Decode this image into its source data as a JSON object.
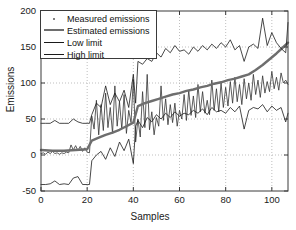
{
  "chart_data": {
    "type": "line",
    "title": "",
    "xlabel": "Samples",
    "ylabel": "Emissions",
    "xlim": [
      0,
      107
    ],
    "ylim": [
      -50,
      200
    ],
    "xticks": [
      0,
      20,
      40,
      60,
      80,
      100
    ],
    "yticks": [
      -50,
      0,
      50,
      100,
      150,
      200
    ],
    "grid": true,
    "grid_style": "dotted",
    "legend_position": "upper-left",
    "legend": [
      {
        "label": "Measured emissions",
        "style": "dot",
        "color": "#555555"
      },
      {
        "label": "Estimated emissions",
        "style": "line",
        "color": "#6e6e6e",
        "width": 2.4
      },
      {
        "label": "Low limit",
        "style": "line",
        "color": "#1a1a1a",
        "width": 0.8
      },
      {
        "label": "High limit",
        "style": "line",
        "color": "#1a1a1a",
        "width": 0.8
      }
    ],
    "series": [
      {
        "name": "Measured emissions",
        "color": "#333333",
        "width": 0.8,
        "x": [
          0,
          1,
          2,
          3,
          4,
          5,
          6,
          7,
          8,
          9,
          10,
          11,
          12,
          13,
          14,
          15,
          16,
          17,
          18,
          19,
          20,
          21,
          22,
          23,
          24,
          25,
          26,
          27,
          28,
          29,
          30,
          31,
          32,
          33,
          34,
          35,
          36,
          37,
          38,
          39,
          40,
          41,
          42,
          43,
          44,
          45,
          46,
          47,
          48,
          49,
          50,
          51,
          52,
          53,
          54,
          55,
          56,
          57,
          58,
          59,
          60,
          61,
          62,
          63,
          64,
          65,
          66,
          67,
          68,
          69,
          70,
          71,
          72,
          73,
          74,
          75,
          76,
          77,
          78,
          79,
          80,
          81,
          82,
          83,
          84,
          85,
          86,
          87,
          88,
          89,
          90,
          91,
          92,
          93,
          94,
          95,
          96,
          97,
          98,
          99,
          100,
          101,
          102,
          103,
          104,
          105,
          106,
          107
        ],
        "y": [
          2,
          3,
          1,
          4,
          2,
          5,
          2,
          3,
          1,
          3,
          2,
          4,
          3,
          14,
          7,
          13,
          6,
          12,
          5,
          10,
          4,
          3,
          54,
          36,
          76,
          28,
          70,
          34,
          86,
          38,
          66,
          30,
          96,
          40,
          74,
          36,
          84,
          30,
          62,
          45,
          105,
          18,
          50,
          25,
          88,
          38,
          112,
          35,
          60,
          28,
          52,
          40,
          96,
          48,
          78,
          42,
          70,
          45,
          72,
          40,
          62,
          50,
          84,
          48,
          90,
          55,
          82,
          52,
          98,
          60,
          88,
          58,
          76,
          56,
          104,
          62,
          92,
          60,
          100,
          66,
          94,
          68,
          102,
          72,
          108,
          74,
          98,
          70,
          106,
          78,
          100,
          76,
          112,
          84,
          104,
          80,
          110,
          86,
          102,
          88,
          116,
          92,
          108,
          90,
          114,
          100,
          104,
          98
        ]
      },
      {
        "name": "Estimated emissions",
        "color": "#6e6e6e",
        "width": 2.4,
        "x": [
          0,
          5,
          10,
          15,
          20,
          22,
          25,
          28,
          31,
          34,
          37,
          40,
          42,
          45,
          48,
          51,
          54,
          57,
          60,
          63,
          66,
          69,
          72,
          75,
          78,
          81,
          84,
          87,
          90,
          93,
          96,
          99,
          102,
          105,
          107
        ],
        "y": [
          7,
          6,
          6,
          7,
          8,
          20,
          24,
          28,
          31,
          35,
          40,
          45,
          68,
          72,
          75,
          78,
          81,
          84,
          86,
          89,
          91,
          94,
          96,
          99,
          101,
          104,
          106,
          109,
          112,
          118,
          125,
          133,
          141,
          150,
          156
        ]
      },
      {
        "name": "Low limit",
        "color": "#1a1a1a",
        "width": 0.8,
        "x": [
          0,
          2,
          4,
          6,
          8,
          10,
          12,
          14,
          16,
          18,
          20,
          21,
          22,
          24,
          26,
          28,
          30,
          32,
          34,
          36,
          38,
          40,
          41,
          42,
          44,
          46,
          48,
          50,
          52,
          54,
          56,
          58,
          60,
          62,
          64,
          66,
          68,
          70,
          72,
          74,
          76,
          78,
          80,
          82,
          84,
          86,
          88,
          90,
          92,
          94,
          96,
          98,
          100,
          102,
          104,
          106,
          107
        ],
        "y": [
          -41,
          -41,
          -40,
          -36,
          -41,
          -40,
          -41,
          -32,
          -30,
          -41,
          -41,
          -41,
          -8,
          0,
          5,
          -6,
          10,
          -2,
          18,
          6,
          22,
          -12,
          40,
          48,
          38,
          52,
          46,
          56,
          50,
          58,
          52,
          60,
          54,
          58,
          56,
          62,
          58,
          64,
          56,
          66,
          60,
          62,
          58,
          66,
          60,
          68,
          36,
          62,
          66,
          64,
          70,
          60,
          68,
          62,
          66,
          46,
          58
        ]
      },
      {
        "name": "High limit",
        "color": "#1a1a1a",
        "width": 0.8,
        "x": [
          0,
          2,
          4,
          6,
          8,
          10,
          12,
          14,
          16,
          18,
          20,
          21,
          22,
          24,
          26,
          28,
          30,
          32,
          34,
          36,
          38,
          40,
          41,
          42,
          44,
          46,
          48,
          50,
          52,
          54,
          56,
          58,
          60,
          62,
          64,
          66,
          68,
          70,
          72,
          74,
          76,
          78,
          80,
          82,
          84,
          86,
          88,
          90,
          92,
          94,
          96,
          98,
          100,
          102,
          104,
          106,
          107
        ],
        "y": [
          44,
          44,
          44,
          48,
          44,
          44,
          44,
          50,
          46,
          44,
          44,
          44,
          56,
          72,
          66,
          96,
          70,
          86,
          74,
          90,
          66,
          112,
          72,
          130,
          126,
          134,
          130,
          142,
          136,
          148,
          142,
          152,
          144,
          146,
          140,
          150,
          144,
          152,
          146,
          154,
          148,
          156,
          150,
          160,
          146,
          152,
          130,
          150,
          154,
          148,
          190,
          152,
          170,
          156,
          148,
          142,
          184
        ]
      }
    ]
  },
  "axes": {
    "ylabel": "Emissions",
    "xlabel": "Samples",
    "ytick_labels": [
      "200",
      "150",
      "100",
      "50",
      "0",
      "-50"
    ],
    "xtick_labels": [
      "0",
      "20",
      "40",
      "60",
      "80",
      "100"
    ]
  },
  "legend": {
    "items": [
      {
        "label": "Measured emissions"
      },
      {
        "label": "Estimated emissions"
      },
      {
        "label": "Low limit"
      },
      {
        "label": "High limit"
      }
    ]
  },
  "colors": {
    "axis": "#3a3a3a",
    "grid": "#b8b8b8",
    "measured": "#333333",
    "estimated": "#6e6e6e",
    "limits": "#1a1a1a",
    "background": "#ffffff"
  }
}
